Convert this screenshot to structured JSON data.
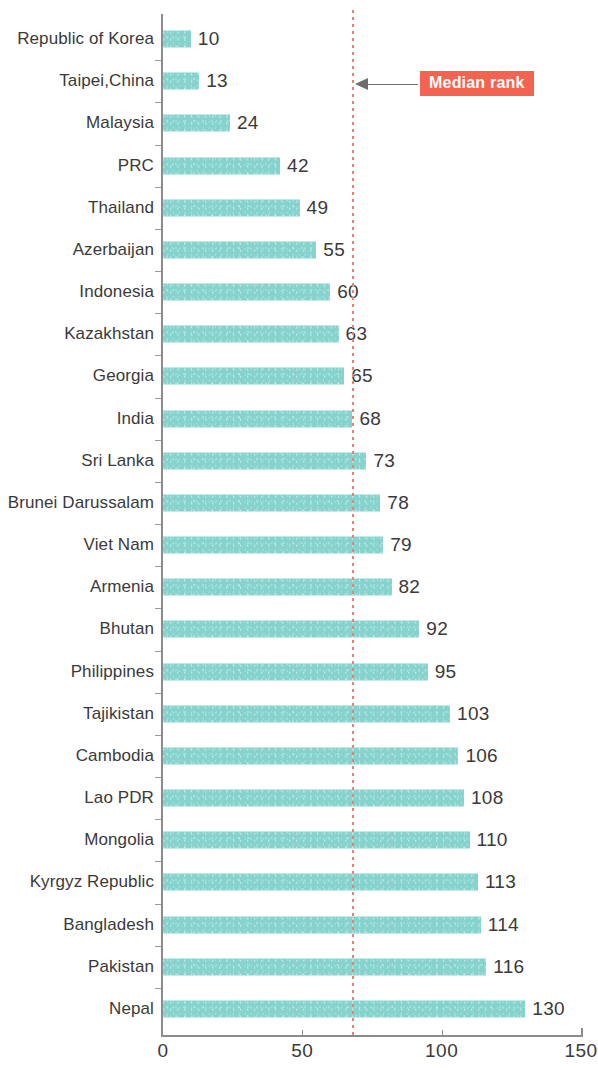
{
  "chart_data": {
    "type": "bar",
    "orientation": "horizontal",
    "title": "",
    "subtitle": "",
    "xlabel": "",
    "ylabel": "",
    "xlim": [
      0,
      150
    ],
    "ylim": null,
    "grid": false,
    "legend": null,
    "bar_color": "#86d3ce",
    "categories": [
      "Republic of Korea",
      "Taipei,China",
      "Malaysia",
      "PRC",
      "Thailand",
      "Azerbaijan",
      "Indonesia",
      "Kazakhstan",
      "Georgia",
      "India",
      "Sri Lanka",
      "Brunei Darussalam",
      "Viet Nam",
      "Armenia",
      "Bhutan",
      "Philippines",
      "Tajikistan",
      "Cambodia",
      "Lao PDR",
      "Mongolia",
      "Kyrgyz Republic",
      "Bangladesh",
      "Pakistan",
      "Nepal"
    ],
    "values": [
      10,
      13,
      24,
      42,
      49,
      55,
      60,
      63,
      65,
      68,
      73,
      78,
      79,
      82,
      92,
      95,
      103,
      106,
      108,
      110,
      113,
      114,
      116,
      130
    ],
    "xticks": [
      0,
      50,
      100,
      150
    ],
    "xtick_labels": [
      "0",
      "50",
      "100",
      "150"
    ],
    "annotations": [
      {
        "name": "median-rank",
        "label": "Median rank",
        "value": 68,
        "style": "dotted-vertical-line",
        "line_color": "#ef8070",
        "badge_color": "#f4634f",
        "badge_text_color": "#ffffff"
      }
    ]
  }
}
